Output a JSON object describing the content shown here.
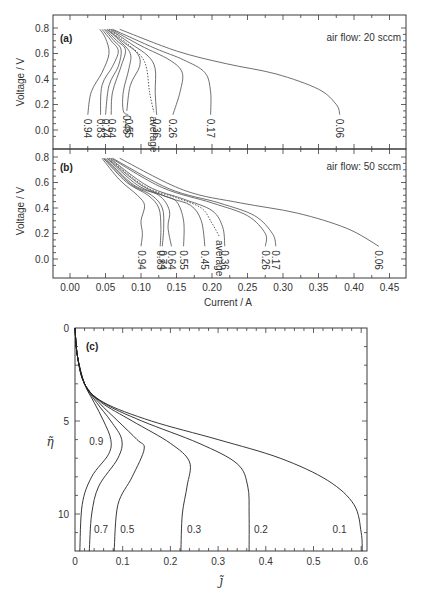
{
  "chart_data": [
    {
      "id": "a",
      "type": "line",
      "panel_label": "(a)",
      "annotation": "air flow: 20 sccm",
      "xlabel": "Current / A",
      "ylabel": "Voltage / V",
      "xlim": [
        -0.025,
        0.475
      ],
      "ylim": [
        -0.15,
        0.85
      ],
      "xticks": [
        "0.00",
        "0.05",
        "0.10",
        "0.15",
        "0.20",
        "0.25",
        "0.30",
        "0.35",
        "0.40",
        "0.45"
      ],
      "yticks": [
        "0.0",
        "0.2",
        "0.4",
        "0.6",
        "0.8"
      ],
      "series": [
        {
          "name": "0.94",
          "points": [
            [
              0.042,
              0.79
            ],
            [
              0.05,
              0.72
            ],
            [
              0.055,
              0.6
            ],
            [
              0.045,
              0.45
            ],
            [
              0.03,
              0.3
            ],
            [
              0.025,
              0.12
            ]
          ]
        },
        {
          "name": "0.83",
          "points": [
            [
              0.045,
              0.79
            ],
            [
              0.058,
              0.7
            ],
            [
              0.068,
              0.62
            ],
            [
              0.06,
              0.5
            ],
            [
              0.045,
              0.35
            ],
            [
              0.043,
              0.12
            ]
          ]
        },
        {
          "name": "0.74",
          "points": [
            [
              0.048,
              0.79
            ],
            [
              0.062,
              0.7
            ],
            [
              0.072,
              0.63
            ],
            [
              0.068,
              0.5
            ],
            [
              0.055,
              0.35
            ],
            [
              0.05,
              0.12
            ]
          ]
        },
        {
          "name": "0.64",
          "points": [
            [
              0.05,
              0.79
            ],
            [
              0.066,
              0.7
            ],
            [
              0.078,
              0.63
            ],
            [
              0.072,
              0.5
            ],
            [
              0.06,
              0.3
            ],
            [
              0.058,
              0.12
            ]
          ]
        },
        {
          "name": "0.55",
          "points": [
            [
              0.052,
              0.79
            ],
            [
              0.07,
              0.7
            ],
            [
              0.085,
              0.6
            ],
            [
              0.083,
              0.48
            ],
            [
              0.075,
              0.3
            ],
            [
              0.075,
              0.15
            ],
            [
              0.082,
              0.12
            ]
          ]
        },
        {
          "name": "0.45",
          "points": [
            [
              0.053,
              0.79
            ],
            [
              0.075,
              0.69
            ],
            [
              0.095,
              0.6
            ],
            [
              0.098,
              0.5
            ],
            [
              0.085,
              0.35
            ],
            [
              0.08,
              0.15
            ]
          ]
        },
        {
          "name": "average",
          "dashed": true,
          "points": [
            [
              0.055,
              0.79
            ],
            [
              0.08,
              0.68
            ],
            [
              0.1,
              0.58
            ],
            [
              0.108,
              0.48
            ],
            [
              0.112,
              0.3
            ],
            [
              0.118,
              0.14
            ]
          ]
        },
        {
          "name": "0.36",
          "points": [
            [
              0.056,
              0.79
            ],
            [
              0.085,
              0.68
            ],
            [
              0.11,
              0.58
            ],
            [
              0.12,
              0.48
            ],
            [
              0.12,
              0.3
            ],
            [
              0.122,
              0.12
            ]
          ]
        },
        {
          "name": "0.26",
          "points": [
            [
              0.058,
              0.79
            ],
            [
              0.1,
              0.66
            ],
            [
              0.14,
              0.55
            ],
            [
              0.158,
              0.45
            ],
            [
              0.155,
              0.3
            ],
            [
              0.145,
              0.12
            ]
          ]
        },
        {
          "name": "0.17",
          "points": [
            [
              0.06,
              0.79
            ],
            [
              0.12,
              0.64
            ],
            [
              0.16,
              0.55
            ],
            [
              0.19,
              0.45
            ],
            [
              0.198,
              0.3
            ],
            [
              0.198,
              0.12
            ]
          ]
        },
        {
          "name": "0.06",
          "points": [
            [
              0.07,
              0.79
            ],
            [
              0.15,
              0.62
            ],
            [
              0.22,
              0.52
            ],
            [
              0.29,
              0.44
            ],
            [
              0.35,
              0.32
            ],
            [
              0.375,
              0.2
            ],
            [
              0.38,
              0.12
            ]
          ]
        }
      ]
    },
    {
      "id": "b",
      "type": "line",
      "panel_label": "(b)",
      "annotation": "air flow: 50 sccm",
      "xlabel": "Current / A",
      "ylabel": "Voltage / V",
      "xlim": [
        -0.025,
        0.475
      ],
      "ylim": [
        -0.15,
        0.85
      ],
      "xticks": [
        "0.00",
        "0.05",
        "0.10",
        "0.15",
        "0.20",
        "0.25",
        "0.30",
        "0.35",
        "0.40",
        "0.45"
      ],
      "yticks": [
        "0.0",
        "0.2",
        "0.4",
        "0.6",
        "0.8"
      ],
      "series": [
        {
          "name": "0.94",
          "points": [
            [
              0.045,
              0.79
            ],
            [
              0.07,
              0.62
            ],
            [
              0.095,
              0.5
            ],
            [
              0.105,
              0.42
            ],
            [
              0.1,
              0.3
            ],
            [
              0.102,
              0.2
            ],
            [
              0.1,
              0.1
            ]
          ]
        },
        {
          "name": "0.83",
          "points": [
            [
              0.047,
              0.79
            ],
            [
              0.08,
              0.6
            ],
            [
              0.11,
              0.5
            ],
            [
              0.125,
              0.4
            ],
            [
              0.128,
              0.25
            ],
            [
              0.127,
              0.1
            ]
          ]
        },
        {
          "name": "0.74",
          "points": [
            [
              0.048,
              0.79
            ],
            [
              0.085,
              0.59
            ],
            [
              0.115,
              0.5
            ],
            [
              0.13,
              0.4
            ],
            [
              0.132,
              0.25
            ],
            [
              0.13,
              0.1
            ]
          ]
        },
        {
          "name": "0.64",
          "points": [
            [
              0.05,
              0.79
            ],
            [
              0.09,
              0.58
            ],
            [
              0.125,
              0.5
            ],
            [
              0.14,
              0.38
            ],
            [
              0.138,
              0.25
            ],
            [
              0.143,
              0.1
            ]
          ]
        },
        {
          "name": "0.55",
          "points": [
            [
              0.052,
              0.79
            ],
            [
              0.095,
              0.58
            ],
            [
              0.13,
              0.5
            ],
            [
              0.15,
              0.45
            ],
            [
              0.16,
              0.3
            ],
            [
              0.16,
              0.1
            ]
          ]
        },
        {
          "name": "0.45",
          "points": [
            [
              0.053,
              0.79
            ],
            [
              0.1,
              0.58
            ],
            [
              0.14,
              0.48
            ],
            [
              0.17,
              0.42
            ],
            [
              0.185,
              0.3
            ],
            [
              0.19,
              0.1
            ]
          ]
        },
        {
          "name": "average",
          "dashed": true,
          "points": [
            [
              0.055,
              0.79
            ],
            [
              0.105,
              0.57
            ],
            [
              0.15,
              0.48
            ],
            [
              0.185,
              0.4
            ],
            [
              0.2,
              0.28
            ],
            [
              0.21,
              0.18
            ]
          ]
        },
        {
          "name": "0.36",
          "points": [
            [
              0.056,
              0.79
            ],
            [
              0.11,
              0.57
            ],
            [
              0.16,
              0.47
            ],
            [
              0.2,
              0.38
            ],
            [
              0.215,
              0.25
            ],
            [
              0.218,
              0.1
            ]
          ]
        },
        {
          "name": "0.26",
          "points": [
            [
              0.058,
              0.79
            ],
            [
              0.13,
              0.56
            ],
            [
              0.2,
              0.44
            ],
            [
              0.25,
              0.34
            ],
            [
              0.275,
              0.2
            ],
            [
              0.275,
              0.1
            ]
          ]
        },
        {
          "name": "0.17",
          "points": [
            [
              0.06,
              0.79
            ],
            [
              0.14,
              0.55
            ],
            [
              0.21,
              0.44
            ],
            [
              0.26,
              0.34
            ],
            [
              0.285,
              0.2
            ],
            [
              0.29,
              0.1
            ]
          ]
        },
        {
          "name": "0.06",
          "points": [
            [
              0.07,
              0.79
            ],
            [
              0.16,
              0.54
            ],
            [
              0.24,
              0.44
            ],
            [
              0.32,
              0.36
            ],
            [
              0.39,
              0.24
            ],
            [
              0.435,
              0.1
            ]
          ]
        }
      ]
    },
    {
      "id": "c",
      "type": "line",
      "panel_label": "(c)",
      "xlabel": "j̃",
      "ylabel": "η̃",
      "xlim": [
        0,
        0.615
      ],
      "ylim": [
        12,
        0
      ],
      "y_inverted": true,
      "xticks": [
        "0",
        "0.1",
        "0.2",
        "0.3",
        "0.4",
        "0.5",
        "0.6"
      ],
      "yticks": [
        "0",
        "5",
        "10"
      ],
      "series": [
        {
          "name": "0.9",
          "points": [
            [
              0.0,
              0.0
            ],
            [
              0.005,
              1.5
            ],
            [
              0.02,
              3.0
            ],
            [
              0.04,
              4.0
            ],
            [
              0.06,
              5.0
            ],
            [
              0.075,
              6.0
            ],
            [
              0.07,
              6.8
            ],
            [
              0.035,
              8.0
            ],
            [
              0.015,
              9.5
            ],
            [
              0.01,
              12.0
            ]
          ]
        },
        {
          "name": "0.7",
          "points": [
            [
              0.0,
              0.0
            ],
            [
              0.005,
              1.5
            ],
            [
              0.02,
              3.0
            ],
            [
              0.045,
              4.0
            ],
            [
              0.075,
              5.0
            ],
            [
              0.098,
              6.0
            ],
            [
              0.09,
              7.0
            ],
            [
              0.05,
              8.5
            ],
            [
              0.035,
              10.0
            ],
            [
              0.03,
              12.0
            ]
          ]
        },
        {
          "name": "0.5",
          "points": [
            [
              0.0,
              0.0
            ],
            [
              0.005,
              1.5
            ],
            [
              0.02,
              3.0
            ],
            [
              0.05,
              4.0
            ],
            [
              0.09,
              5.0
            ],
            [
              0.13,
              6.0
            ],
            [
              0.145,
              6.5
            ],
            [
              0.12,
              8.0
            ],
            [
              0.09,
              9.5
            ],
            [
              0.082,
              12.0
            ]
          ]
        },
        {
          "name": "0.3",
          "points": [
            [
              0.0,
              0.0
            ],
            [
              0.005,
              1.5
            ],
            [
              0.02,
              3.0
            ],
            [
              0.055,
              4.0
            ],
            [
              0.12,
              5.0
            ],
            [
              0.2,
              6.2
            ],
            [
              0.24,
              7.2
            ],
            [
              0.235,
              8.5
            ],
            [
              0.225,
              10.0
            ],
            [
              0.222,
              12.0
            ]
          ]
        },
        {
          "name": "0.2",
          "points": [
            [
              0.0,
              0.0
            ],
            [
              0.005,
              1.5
            ],
            [
              0.02,
              3.0
            ],
            [
              0.058,
              4.0
            ],
            [
              0.14,
              5.0
            ],
            [
              0.26,
              6.2
            ],
            [
              0.34,
              7.3
            ],
            [
              0.362,
              8.5
            ],
            [
              0.365,
              10.0
            ],
            [
              0.365,
              12.0
            ]
          ]
        },
        {
          "name": "0.1",
          "points": [
            [
              0.0,
              0.0
            ],
            [
              0.005,
              1.5
            ],
            [
              0.02,
              3.0
            ],
            [
              0.06,
              4.0
            ],
            [
              0.16,
              5.0
            ],
            [
              0.3,
              6.0
            ],
            [
              0.43,
              7.0
            ],
            [
              0.53,
              8.2
            ],
            [
              0.585,
              9.5
            ],
            [
              0.6,
              11.0
            ],
            [
              0.602,
              12.0
            ]
          ]
        }
      ]
    }
  ],
  "figure": {
    "panel_a": {
      "label": "(a)",
      "note": "air flow: 20 sccm",
      "ylabel": "Voltage / V"
    },
    "panel_b": {
      "label": "(b)",
      "note": "air flow: 50 sccm",
      "ylabel": "Voltage / V",
      "xlabel": "Current / A"
    },
    "panel_c": {
      "label": "(c)",
      "ylabel": "η̃",
      "xlabel": "j̃"
    }
  }
}
